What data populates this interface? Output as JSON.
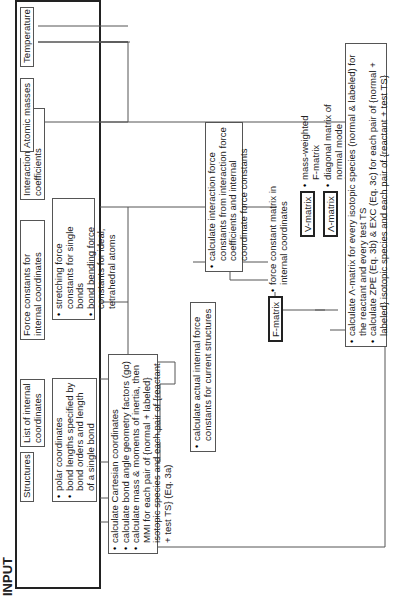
{
  "input_label": "INPUT",
  "inputs": {
    "structures": "Structures",
    "internal_coords": "List of internal coordinates",
    "force_constants": "Force constants for internal coordinates",
    "interaction": "Interaction force coefficients",
    "atomic_masses": "Atomic masses",
    "temperature": "Temperature"
  },
  "structures_notes": [
    "polar coordinates",
    "bond lengths specified by bond orders and length of a single bond"
  ],
  "force_constant_notes": [
    "stretching force constants for single bonds",
    "bond bending force constants for ideal, tetrahedral atoms"
  ],
  "calc_cartesian": [
    "calculate Cartesian coordinates",
    "calculate bond angle geometry factors (gα)",
    "calculate mass & moments of inertia, then MMI for each pair of {normal + labeled} isotopic species and each pair of {reactant + test TS} (Eq. 3a)"
  ],
  "calc_actual_force": "calculate actual internal force constants for current structures",
  "calc_interaction": "calculate interaction force constants from interaction force coefficients and internal coordinate force constants",
  "f_matrix": {
    "label": "F-matrix",
    "desc": "force constant matrix in internal coordinates"
  },
  "v_matrix": {
    "label": "V-matrix",
    "desc": "mass-weighted F-matrix"
  },
  "lambda_matrix": {
    "label": "Λ-matrix",
    "desc": "diagonal matrix of normal mode frequencies"
  },
  "final_calc": [
    "calculate Λ-matrix for every isotopic species (normal & labeled) for the reactant and every test TS",
    "calculate ZPE (Eq. 3b) & EXC (Eq. 3c) for each pair of {normal + labeled} isotopic species and each pair of {reactant + test TS}"
  ]
}
